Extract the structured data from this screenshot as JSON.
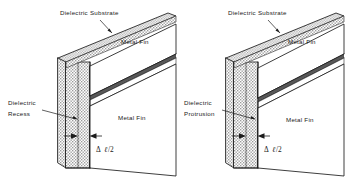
{
  "figure": {
    "background_color": "#ffffff",
    "line_color": "#1c1c1c",
    "substrate_fill": "#d9d9d9",
    "metal_fill": "#585858"
  },
  "panels": [
    {
      "id": "left",
      "name": "dielectric-recess-panel",
      "labels": {
        "substrate": "Dielectric Substrate",
        "metal_fin_top": "Metal Fin",
        "metal_fin_bottom": "Metal Fin",
        "feature_line1": "Dielectric",
        "feature_line2": "Recess",
        "dimension_delta": "Δ",
        "dimension_ell": "ℓ",
        "dimension_div": "/2"
      }
    },
    {
      "id": "right",
      "name": "dielectric-protrusion-panel",
      "labels": {
        "substrate": "Dielectric Substrate",
        "metal_fin_top": "Metal Fin",
        "metal_fin_bottom": "Metal Fin",
        "feature_line1": "Dielectric",
        "feature_line2": "Protrusion",
        "dimension_delta": "Δ",
        "dimension_ell": "ℓ",
        "dimension_div": "/2"
      }
    }
  ]
}
